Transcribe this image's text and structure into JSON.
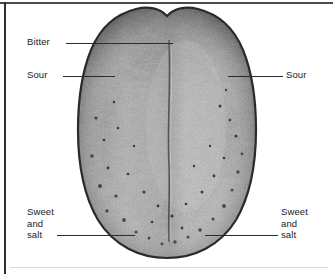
{
  "figure": {
    "background_color": "#ffffff",
    "line_color": "#2b2b2b",
    "frame": {
      "top_rule_color": "#4a4a4a",
      "left_rule_color": "#2e2e2e",
      "bottom_rule_color": "#dcdcdc"
    }
  },
  "labels": {
    "bitter": "Bitter",
    "sour_left": "Sour",
    "sour_right": "Sour",
    "sweet_salt_left": "Sweet\nand\nsalt",
    "sweet_salt_right": "Sweet\nand\nsalt"
  }
}
